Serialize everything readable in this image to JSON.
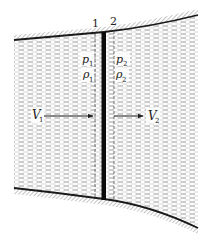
{
  "diagram": {
    "type": "normal-shock-wave-in-duct",
    "colors": {
      "background": "#ffffff",
      "fluid_dash": "#9a9a9a",
      "wall": "#1a1a1a",
      "hatch": "#7a7a7a",
      "shock": "#0a0a0a",
      "section_dash": "#555555",
      "text": "#222222"
    },
    "sections": [
      {
        "id": "1",
        "label": "1"
      },
      {
        "id": "2",
        "label": "2"
      }
    ],
    "upstream": {
      "pressure_label": "p",
      "pressure_sub": "1",
      "density_label": "ρ",
      "density_sub": "1",
      "velocity_label": "V",
      "velocity_sub": "1"
    },
    "downstream": {
      "pressure_label": "p",
      "pressure_sub": "2",
      "density_label": "ρ",
      "density_sub": "2",
      "velocity_label": "V",
      "velocity_sub": "2"
    }
  }
}
